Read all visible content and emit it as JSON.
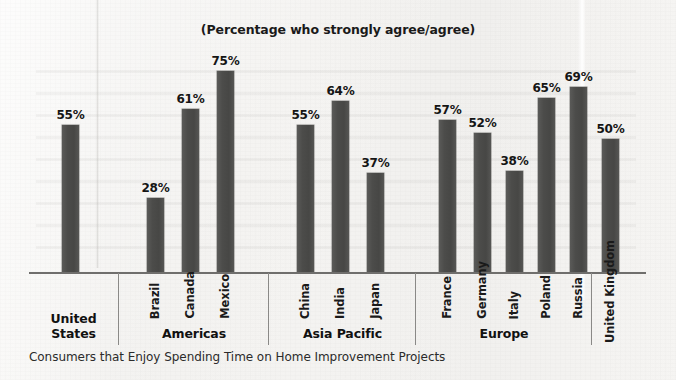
{
  "chart_data": {
    "type": "bar",
    "title": "(Percentage who strongly agree/agree)",
    "caption": "Consumers that Enjoy Spending Time on Home Improvement Projects",
    "xlabel": "",
    "ylabel": "",
    "ylim": [
      0,
      80
    ],
    "grid": false,
    "legend": "none",
    "value_suffix": "%",
    "bar_color": "#4c4c4a",
    "categories": [
      "United States",
      "Brazil",
      "Canada",
      "Mexico",
      "China",
      "India",
      "Japan",
      "France",
      "Germany",
      "Italy",
      "Poland",
      "Russia",
      "United Kingdom"
    ],
    "values": [
      55,
      28,
      61,
      75,
      55,
      64,
      37,
      57,
      52,
      38,
      65,
      69,
      50
    ],
    "value_labels": [
      "55%",
      "28%",
      "61%",
      "75%",
      "55%",
      "64%",
      "37%",
      "57%",
      "52%",
      "38%",
      "65%",
      "69%",
      "50%"
    ],
    "groups": [
      {
        "region": "United States",
        "region_label_shown": true,
        "country_labels_shown": false,
        "countries": [
          {
            "name": "United States",
            "value": 55,
            "label": "55%"
          }
        ]
      },
      {
        "region": "Americas",
        "region_label_shown": true,
        "country_labels_shown": true,
        "countries": [
          {
            "name": "Brazil",
            "value": 28,
            "label": "28%"
          },
          {
            "name": "Canada",
            "value": 61,
            "label": "61%"
          },
          {
            "name": "Mexico",
            "value": 75,
            "label": "75%"
          }
        ]
      },
      {
        "region": "Asia Pacific",
        "region_label_shown": true,
        "country_labels_shown": true,
        "countries": [
          {
            "name": "China",
            "value": 55,
            "label": "55%"
          },
          {
            "name": "India",
            "value": 64,
            "label": "64%"
          },
          {
            "name": "Japan",
            "value": 37,
            "label": "37%"
          }
        ]
      },
      {
        "region": "Europe",
        "region_label_shown": true,
        "country_labels_shown": true,
        "countries": [
          {
            "name": "France",
            "value": 57,
            "label": "57%"
          },
          {
            "name": "Germany",
            "value": 52,
            "label": "52%"
          },
          {
            "name": "Italy",
            "value": 38,
            "label": "38%"
          },
          {
            "name": "Poland",
            "value": 65,
            "label": "65%"
          },
          {
            "name": "Russia",
            "value": 69,
            "label": "69%"
          }
        ]
      },
      {
        "region": "",
        "region_label_shown": false,
        "country_labels_shown": true,
        "countries": [
          {
            "name": "United Kingdom",
            "value": 50,
            "label": "50%"
          }
        ]
      }
    ]
  }
}
